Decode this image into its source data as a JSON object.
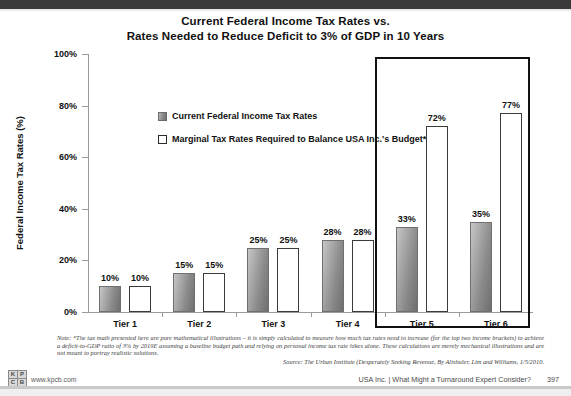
{
  "title": {
    "line1": "Current Federal Income Tax Rates vs.",
    "line2": "Rates Needed to Reduce Deficit to 3% of GDP in 10 Years"
  },
  "legend": {
    "items": [
      {
        "label": "Current Federal Income Tax Rates",
        "style": "filled"
      },
      {
        "label": "Marginal Tax Rates Required to Balance USA Inc.'s Budget*",
        "style": "hollow"
      }
    ]
  },
  "axis": {
    "y_title": "Federal Income Tax Rates (%)",
    "y_ticks": [
      "0%",
      "20%",
      "40%",
      "60%",
      "80%",
      "100%"
    ]
  },
  "bars": [
    {
      "tier": "Tier 1",
      "current": "10%",
      "required": "10%"
    },
    {
      "tier": "Tier 2",
      "current": "15%",
      "required": "15%"
    },
    {
      "tier": "Tier 3",
      "current": "25%",
      "required": "25%"
    },
    {
      "tier": "Tier 4",
      "current": "28%",
      "required": "28%"
    },
    {
      "tier": "Tier 5",
      "current": "33%",
      "required": "72%"
    },
    {
      "tier": "Tier 6",
      "current": "35%",
      "required": "77%"
    }
  ],
  "note": {
    "text": "Note: *The tax math presented here are pure mathematical illustrations – it is simply calculated to measure how much tax rates need to increase (for the top two income brackets) to achieve a deficit-to-GDP ratio of 3% by 2019E assuming a baseline budget path and relying on personal income tax rate hikes alone.  These calculations are merely mechanical illustrations and are not meant to portray realistic solutions."
  },
  "source": {
    "text": "Source: The Urban Institute (Desperately Seeking Revenue, By Altshuler, Lim and Williams, 1/5/2010."
  },
  "footer": {
    "logo_cells": [
      "K",
      "P",
      "C",
      "B"
    ],
    "url": "www.kpcb.com",
    "deck_title": "USA Inc. | What Might a Turnaround Expert Consider?",
    "page_number": "397"
  },
  "chart_data": {
    "type": "bar",
    "title": "Current Federal Income Tax Rates vs. Rates Needed to Reduce Deficit to 3% of GDP in 10 Years",
    "xlabel": "",
    "ylabel": "Federal Income Tax Rates (%)",
    "ylim": [
      0,
      100
    ],
    "yticks": [
      0,
      20,
      40,
      60,
      80,
      100
    ],
    "grid": false,
    "legend_position": "upper-left",
    "categories": [
      "Tier 1",
      "Tier 2",
      "Tier 3",
      "Tier 4",
      "Tier 5",
      "Tier 6"
    ],
    "series": [
      {
        "name": "Current Federal Income Tax Rates",
        "values": [
          10,
          15,
          25,
          28,
          33,
          35
        ],
        "color": "#8a8a8a"
      },
      {
        "name": "Marginal Tax Rates Required to Balance USA Inc.'s Budget*",
        "values": [
          10,
          15,
          25,
          28,
          72,
          77
        ],
        "color": "#ffffff"
      }
    ],
    "annotations": [
      "Highlight box around Tier 5 and Tier 6"
    ]
  }
}
